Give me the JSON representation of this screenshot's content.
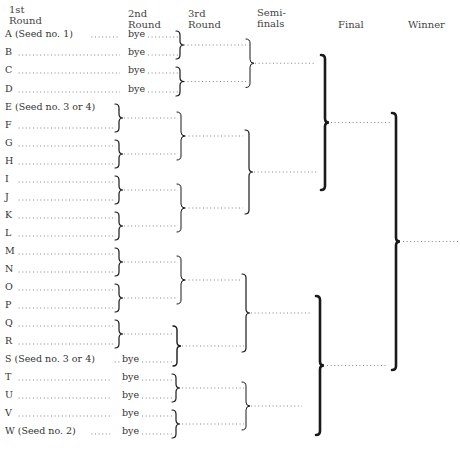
{
  "headers": {
    "round1": [
      "1st",
      "Round"
    ],
    "round2": [
      "2nd",
      "Round"
    ],
    "round3": [
      "3rd",
      "Round"
    ],
    "semifinals": [
      "Semi-",
      "finals"
    ],
    "final": "Final",
    "winner": "Winner"
  },
  "entrants": [
    {
      "label": "A (Seed no. 1)",
      "bye": "bye"
    },
    {
      "label": "B",
      "bye": "bye"
    },
    {
      "label": "C",
      "bye": "bye"
    },
    {
      "label": "D",
      "bye": "bye"
    },
    {
      "label": "E (Seed no. 3 or 4)",
      "bye": null
    },
    {
      "label": "F",
      "bye": null
    },
    {
      "label": "G",
      "bye": null
    },
    {
      "label": "H",
      "bye": null
    },
    {
      "label": "I",
      "bye": null
    },
    {
      "label": "J",
      "bye": null
    },
    {
      "label": "K",
      "bye": null
    },
    {
      "label": "L",
      "bye": null
    },
    {
      "label": "M",
      "bye": null
    },
    {
      "label": "N",
      "bye": null
    },
    {
      "label": "O",
      "bye": null
    },
    {
      "label": "P",
      "bye": null
    },
    {
      "label": "Q",
      "bye": null
    },
    {
      "label": "R",
      "bye": null
    },
    {
      "label": "S (Seed no. 3 or 4)",
      "bye": "bye"
    },
    {
      "label": "T",
      "bye": "bye"
    },
    {
      "label": "U",
      "bye": "bye"
    },
    {
      "label": "V",
      "bye": "bye"
    },
    {
      "label": "W (Seed no. 2)",
      "bye": "bye"
    }
  ]
}
